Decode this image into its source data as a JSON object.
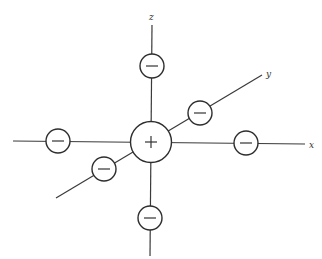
{
  "diagram": {
    "title": "",
    "type": "octahedral-coordination",
    "axes": [
      {
        "name": "x",
        "label": "x"
      },
      {
        "name": "y",
        "label": "y"
      },
      {
        "name": "z",
        "label": "z"
      }
    ],
    "central_ion": {
      "charge_symbol": "+",
      "label": "central-cation"
    },
    "ligands": [
      {
        "position": "+z",
        "charge_symbol": "−"
      },
      {
        "position": "-z",
        "charge_symbol": "−"
      },
      {
        "position": "+x",
        "charge_symbol": "−"
      },
      {
        "position": "-x",
        "charge_symbol": "−"
      },
      {
        "position": "+y",
        "charge_symbol": "−"
      },
      {
        "position": "-y",
        "charge_symbol": "−"
      }
    ],
    "colors": {
      "line": "#3a3a3a",
      "background": "#ffffff"
    }
  }
}
